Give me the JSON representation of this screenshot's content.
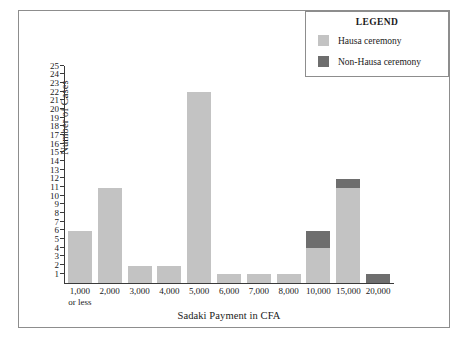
{
  "chart_data": {
    "type": "bar",
    "title": "",
    "xlabel": "Sadaki Payment in CFA",
    "ylabel": "Number of Cases",
    "categories": [
      "1,000 or less",
      "2,000",
      "3,000",
      "4,000",
      "5,000",
      "6,000",
      "7,000",
      "8,000",
      "10,000",
      "15,000",
      "20,000"
    ],
    "category_lines": [
      [
        "1,000",
        "or less"
      ],
      [
        "2,000",
        ""
      ],
      [
        "3,000",
        ""
      ],
      [
        "4,000",
        ""
      ],
      [
        "5,000",
        ""
      ],
      [
        "6,000",
        ""
      ],
      [
        "7,000",
        ""
      ],
      [
        "8,000",
        ""
      ],
      [
        "10,000",
        ""
      ],
      [
        "15,000",
        ""
      ],
      [
        "20,000",
        ""
      ]
    ],
    "series": [
      {
        "name": "Hausa ceremony",
        "color": "#c3c3c3",
        "values": [
          6,
          11,
          2,
          2,
          22,
          1,
          1,
          1,
          4,
          11,
          0
        ]
      },
      {
        "name": "Non-Hausa ceremony",
        "color": "#6e6e6e",
        "values": [
          0,
          0,
          0,
          0,
          0,
          0,
          0,
          0,
          2,
          1,
          1
        ]
      }
    ],
    "stacked": true,
    "ylim": [
      0,
      25
    ],
    "ytick_labels": [
      "25",
      "24",
      "23",
      "22",
      "21",
      "20",
      "19",
      "18",
      "17",
      "16",
      "15",
      "14",
      "13",
      "12",
      "11",
      "10",
      "9",
      "8",
      "7",
      "6",
      "5",
      "4",
      "3",
      "2",
      "1"
    ],
    "ytick_values": [
      25,
      24,
      23,
      22,
      21,
      20,
      19,
      18,
      17,
      16,
      15,
      14,
      13,
      12,
      11,
      10,
      9,
      8,
      7,
      6,
      5,
      4,
      3,
      2,
      1
    ],
    "grid": false,
    "legend": {
      "title": "LEGEND",
      "position": "top-right",
      "entries": [
        {
          "label": "Hausa ceremony",
          "color": "#c3c3c3"
        },
        {
          "label": "Non-Hausa ceremony",
          "color": "#6e6e6e"
        }
      ]
    }
  }
}
